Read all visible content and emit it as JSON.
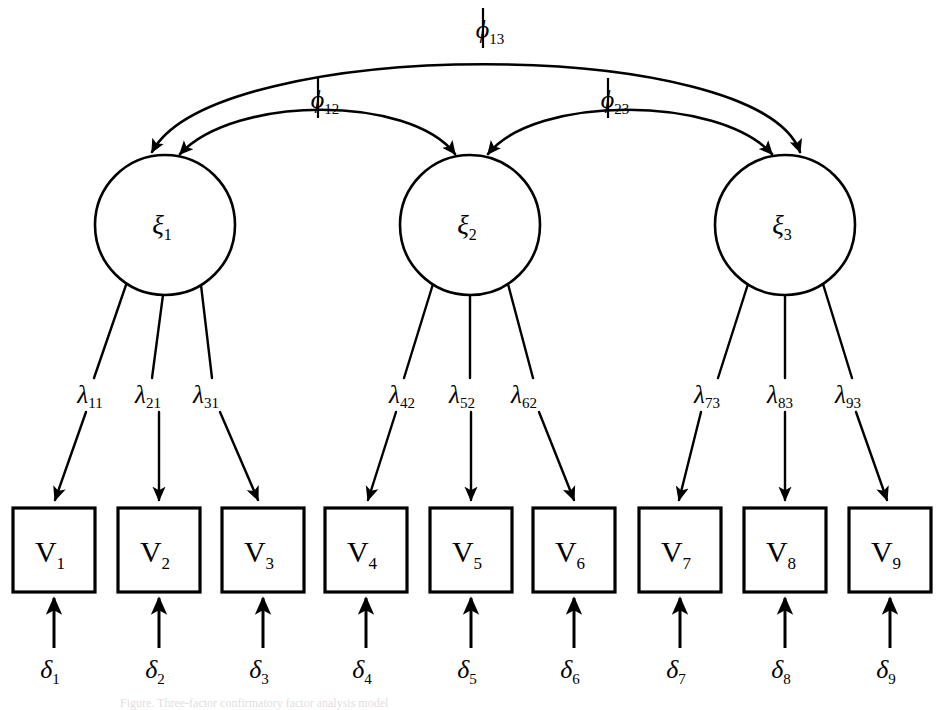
{
  "diagram": {
    "type": "cfa-path-diagram",
    "background_color": "#ffffff",
    "stroke_color": "#000000",
    "caption_partial": "Figure. Three-factor confirmatory factor analysis model"
  },
  "latent_factors": [
    {
      "id": "xi1",
      "symbol": "ξ",
      "subscript": "1",
      "cx": 165,
      "cy": 225,
      "r": 70
    },
    {
      "id": "xi2",
      "symbol": "ξ",
      "subscript": "2",
      "cx": 470,
      "cy": 225,
      "r": 70
    },
    {
      "id": "xi3",
      "symbol": "ξ",
      "subscript": "3",
      "cx": 785,
      "cy": 225,
      "r": 70
    }
  ],
  "indicators": [
    {
      "id": "V1",
      "symbol": "V",
      "subscript": "1",
      "x": 13,
      "y": 508,
      "w": 82,
      "h": 84,
      "factor": "xi1"
    },
    {
      "id": "V2",
      "symbol": "V",
      "subscript": "2",
      "x": 118,
      "y": 508,
      "w": 82,
      "h": 84,
      "factor": "xi1"
    },
    {
      "id": "V3",
      "symbol": "V",
      "subscript": "3",
      "x": 222,
      "y": 508,
      "w": 82,
      "h": 84,
      "factor": "xi1"
    },
    {
      "id": "V4",
      "symbol": "V",
      "subscript": "4",
      "x": 325,
      "y": 508,
      "w": 82,
      "h": 84,
      "factor": "xi2"
    },
    {
      "id": "V5",
      "symbol": "V",
      "subscript": "5",
      "x": 430,
      "y": 508,
      "w": 82,
      "h": 84,
      "factor": "xi2"
    },
    {
      "id": "V6",
      "symbol": "V",
      "subscript": "6",
      "x": 533,
      "y": 508,
      "w": 82,
      "h": 84,
      "factor": "xi2"
    },
    {
      "id": "V7",
      "symbol": "V",
      "subscript": "7",
      "x": 639,
      "y": 508,
      "w": 82,
      "h": 84,
      "factor": "xi3"
    },
    {
      "id": "V8",
      "symbol": "V",
      "subscript": "8",
      "x": 744,
      "y": 508,
      "w": 82,
      "h": 84,
      "factor": "xi3"
    },
    {
      "id": "V9",
      "symbol": "V",
      "subscript": "9",
      "x": 849,
      "y": 508,
      "w": 82,
      "h": 84,
      "factor": "xi3"
    }
  ],
  "loadings": [
    {
      "id": "l11",
      "symbol": "λ",
      "subscript": "11",
      "lx": 90,
      "ly": 400,
      "from": "xi1",
      "to": "V1"
    },
    {
      "id": "l21",
      "symbol": "λ",
      "subscript": "21",
      "lx": 148,
      "ly": 400,
      "from": "xi1",
      "to": "V2"
    },
    {
      "id": "l31",
      "symbol": "λ",
      "subscript": "31",
      "lx": 206,
      "ly": 400,
      "from": "xi1",
      "to": "V3"
    },
    {
      "id": "l42",
      "symbol": "λ",
      "subscript": "42",
      "lx": 402,
      "ly": 400,
      "from": "xi2",
      "to": "V4"
    },
    {
      "id": "l52",
      "symbol": "λ",
      "subscript": "52",
      "lx": 462,
      "ly": 400,
      "from": "xi2",
      "to": "V5"
    },
    {
      "id": "l62",
      "symbol": "λ",
      "subscript": "62",
      "lx": 524,
      "ly": 400,
      "from": "xi2",
      "to": "V6"
    },
    {
      "id": "l73",
      "symbol": "λ",
      "subscript": "73",
      "lx": 707,
      "ly": 400,
      "from": "xi3",
      "to": "V7"
    },
    {
      "id": "l83",
      "symbol": "λ",
      "subscript": "83",
      "lx": 780,
      "ly": 400,
      "from": "xi3",
      "to": "V8"
    },
    {
      "id": "l93",
      "symbol": "λ",
      "subscript": "93",
      "lx": 848,
      "ly": 400,
      "from": "xi3",
      "to": "V9"
    }
  ],
  "errors": [
    {
      "id": "d1",
      "symbol": "δ",
      "subscript": "1",
      "lx": 50,
      "ly": 668,
      "to": "V1"
    },
    {
      "id": "d2",
      "symbol": "δ",
      "subscript": "2",
      "lx": 155,
      "ly": 668,
      "to": "V2"
    },
    {
      "id": "d3",
      "symbol": "δ",
      "subscript": "3",
      "lx": 259,
      "ly": 668,
      "to": "V3"
    },
    {
      "id": "d4",
      "symbol": "δ",
      "subscript": "4",
      "lx": 362,
      "ly": 668,
      "to": "V4"
    },
    {
      "id": "d5",
      "symbol": "δ",
      "subscript": "5",
      "lx": 467,
      "ly": 668,
      "to": "V5"
    },
    {
      "id": "d6",
      "symbol": "δ",
      "subscript": "6",
      "lx": 570,
      "ly": 668,
      "to": "V6"
    },
    {
      "id": "d7",
      "symbol": "δ",
      "subscript": "7",
      "lx": 676,
      "ly": 668,
      "to": "V7"
    },
    {
      "id": "d8",
      "symbol": "δ",
      "subscript": "8",
      "lx": 781,
      "ly": 668,
      "to": "V8"
    },
    {
      "id": "d9",
      "symbol": "δ",
      "subscript": "9",
      "lx": 886,
      "ly": 668,
      "to": "V9"
    }
  ],
  "covariances": [
    {
      "id": "phi12",
      "symbol": "ϕ",
      "subscript": "12",
      "lx": 325,
      "ly": 98,
      "between": [
        "xi1",
        "xi2"
      ]
    },
    {
      "id": "phi23",
      "symbol": "ϕ",
      "subscript": "23",
      "lx": 615,
      "ly": 98,
      "between": [
        "xi2",
        "xi3"
      ]
    },
    {
      "id": "phi13",
      "symbol": "ϕ",
      "subscript": "13",
      "lx": 490,
      "ly": 28,
      "between": [
        "xi1",
        "xi3"
      ]
    }
  ]
}
